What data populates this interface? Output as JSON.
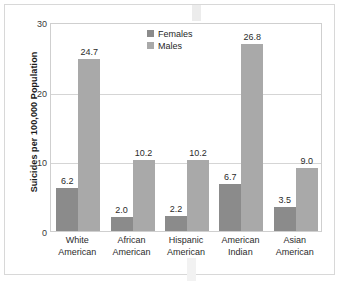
{
  "chart_data": {
    "type": "bar",
    "title": "",
    "xlabel": "",
    "ylabel": "Suicides per 100,000 Population",
    "ylim": [
      0,
      30
    ],
    "yticks": [
      "0",
      "10",
      "20",
      "30"
    ],
    "grid": true,
    "legend_position": "top-center",
    "categories": [
      "White American",
      "African American",
      "Hispanic American",
      "American Indian",
      "Asian American"
    ],
    "category_lines": [
      [
        "White",
        "American"
      ],
      [
        "African",
        "American"
      ],
      [
        "Hispanic",
        "American"
      ],
      [
        "American",
        "Indian"
      ],
      [
        "Asian",
        "American"
      ]
    ],
    "series": [
      {
        "name": "Females",
        "color": "#8b8b8b",
        "values": [
          6.2,
          2.0,
          2.2,
          6.7,
          3.5
        ],
        "labels": [
          "6.2",
          "2.0",
          "2.2",
          "6.7",
          "3.5"
        ]
      },
      {
        "name": "Males",
        "color": "#a9a9a9",
        "values": [
          24.7,
          10.2,
          10.2,
          26.8,
          9.0
        ],
        "labels": [
          "24.7",
          "10.2",
          "10.2",
          "26.8",
          "9.0"
        ]
      }
    ]
  },
  "legend": {
    "items": [
      {
        "label": "Females",
        "color": "#8b8b8b"
      },
      {
        "label": "Males",
        "color": "#a9a9a9"
      }
    ]
  },
  "axis": {
    "y_title": "Suicides per 100,000 Population",
    "y_ticks": [
      "30",
      "20",
      "10",
      "0"
    ]
  }
}
